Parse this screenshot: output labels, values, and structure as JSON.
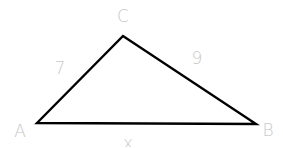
{
  "figure": {
    "type": "triangle",
    "stroke_color": "#000000",
    "label_color": "#c8c8c8",
    "vertices": [
      {
        "name": "A",
        "x": 37,
        "y": 123,
        "label_x": 20,
        "label_y": 131
      },
      {
        "name": "B",
        "x": 256,
        "y": 124,
        "label_x": 268,
        "label_y": 130
      },
      {
        "name": "C",
        "x": 123,
        "y": 36,
        "label_x": 123,
        "label_y": 16
      }
    ],
    "sides": [
      {
        "between": "AC",
        "label": "7",
        "label_x": 60,
        "label_y": 68
      },
      {
        "between": "CB",
        "label": "9",
        "label_x": 197,
        "label_y": 58
      },
      {
        "between": "AB",
        "label": "x",
        "label_x": 128,
        "label_y": 143
      }
    ]
  }
}
